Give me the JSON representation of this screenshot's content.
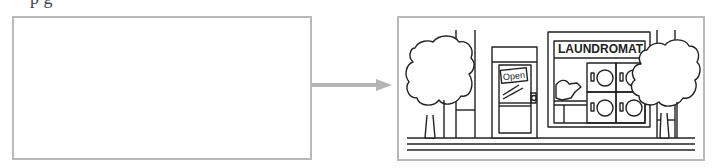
{
  "header": {
    "cut_text": "p g"
  },
  "left_panel": {
    "label": "empty before frame"
  },
  "arrow": {
    "color": "#b5b5b5",
    "direction": "right"
  },
  "right_panel": {
    "scene": "storefront street scene",
    "sign_text": "LAUNDROMAT",
    "door_sign": "Open",
    "colors": {
      "stroke": "#222222",
      "frame": "#b9b9b9"
    }
  }
}
